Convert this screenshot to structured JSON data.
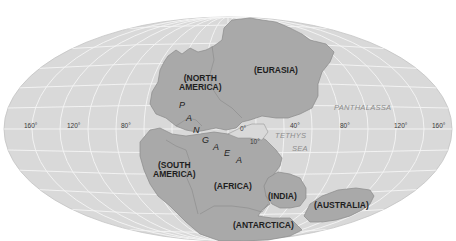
{
  "map": {
    "projection": "elliptical-world",
    "colors": {
      "background": "#ffffff",
      "ocean": "#d9d9d9",
      "grid": "#f4f4f4",
      "land": "#a9a9a9",
      "land_outline": "#8a8a8a",
      "label_text": "#1e1e1e",
      "ocean_label": "#8c8c8c"
    },
    "supercontinent": {
      "name_letters": [
        "P",
        "A",
        "N",
        "G",
        "A",
        "E",
        "A"
      ]
    },
    "continents": [
      {
        "id": "north-america",
        "label_line1": "(NORTH",
        "label_line2": "AMERICA)"
      },
      {
        "id": "eurasia",
        "label": "(EURASIA)"
      },
      {
        "id": "south-america",
        "label_line1": "(SOUTH",
        "label_line2": "AMERICA)"
      },
      {
        "id": "africa",
        "label": "(AFRICA)"
      },
      {
        "id": "india",
        "label": "(INDIA)"
      },
      {
        "id": "antarctica",
        "label": "(ANTARCTICA)"
      },
      {
        "id": "australia",
        "label": "(AUSTRALIA)"
      }
    ],
    "oceans": [
      {
        "id": "panthalassa",
        "label": "PANTHALASSA"
      },
      {
        "id": "tethys-sea",
        "label_line1": "TETHYS",
        "label_line2": "SEA"
      }
    ],
    "longitude_labels": {
      "west": [
        "160°",
        "120°",
        "80°"
      ],
      "east": [
        "40°",
        "80°",
        "120°",
        "160°"
      ],
      "zero": "0°",
      "ten": "10°"
    }
  }
}
